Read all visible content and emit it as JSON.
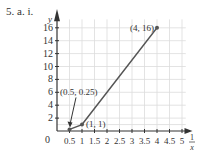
{
  "problem_label": "5. a. i.",
  "chart_data": {
    "type": "line",
    "title": "",
    "xlabel": "1/x",
    "xlabel_num": "1",
    "xlabel_den": "x",
    "ylabel": "y",
    "xlim": [
      0,
      5
    ],
    "ylim": [
      0,
      16
    ],
    "x_ticks": [
      "0.5",
      "1",
      "1.5",
      "2",
      "2.5",
      "3",
      "3.5",
      "4",
      "4.5",
      "5"
    ],
    "y_ticks": [
      "2",
      "4",
      "6",
      "8",
      "10",
      "12",
      "14",
      "16"
    ],
    "origin_label": "0",
    "grid": true,
    "series": [
      {
        "name": "y vs 1/x",
        "x": [
          0.5,
          1,
          4
        ],
        "y": [
          0.25,
          1,
          16
        ]
      }
    ],
    "annotations": [
      {
        "text": "(0.5, 0.25)",
        "x": 0.5,
        "y": 0.25,
        "arrow": true
      },
      {
        "text": "(1, 1)",
        "x": 1,
        "y": 1
      },
      {
        "text": "(4, 16)",
        "x": 4,
        "y": 16
      }
    ]
  },
  "colors": {
    "grid": "#dcdcdc",
    "axis": "#333333",
    "line": "#555555"
  }
}
